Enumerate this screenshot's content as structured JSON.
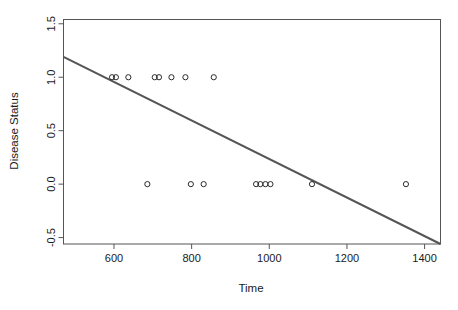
{
  "chart_data": {
    "type": "scatter",
    "title": "",
    "xlabel": "Time",
    "ylabel": "Disease Status",
    "xlim": [
      470,
      1441
    ],
    "ylim": [
      -0.56,
      1.54
    ],
    "grid": false,
    "legend": "none",
    "x_ticks": [
      600,
      800,
      1000,
      1200,
      1400
    ],
    "x_tick_labels": [
      "600",
      "800",
      "1000",
      "1200",
      "1400"
    ],
    "y_ticks": [
      -0.5,
      0.0,
      0.5,
      1.0,
      1.5
    ],
    "y_tick_labels": [
      "-0.5",
      "0.0",
      "0.5",
      "1.0",
      "1.5"
    ],
    "marker": "open-circle",
    "marker_color": "#2b2b2b",
    "points": [
      {
        "x": 595,
        "y": 1.0
      },
      {
        "x": 605,
        "y": 1.0
      },
      {
        "x": 637,
        "y": 1.0
      },
      {
        "x": 705,
        "y": 1.0
      },
      {
        "x": 716,
        "y": 1.0
      },
      {
        "x": 748,
        "y": 1.0
      },
      {
        "x": 784,
        "y": 1.0
      },
      {
        "x": 857,
        "y": 1.0
      },
      {
        "x": 686,
        "y": 0.0
      },
      {
        "x": 798,
        "y": 0.0
      },
      {
        "x": 831,
        "y": 0.0
      },
      {
        "x": 966,
        "y": 0.0
      },
      {
        "x": 977,
        "y": 0.0
      },
      {
        "x": 990,
        "y": 0.0
      },
      {
        "x": 1003,
        "y": 0.0
      },
      {
        "x": 1110,
        "y": 0.0
      },
      {
        "x": 1352,
        "y": 0.0
      }
    ],
    "fit_line": {
      "name": "linear regression",
      "color": "#555555",
      "x_start": 470,
      "y_start": 1.19,
      "x_end": 1441,
      "y_end": -0.56
    }
  }
}
